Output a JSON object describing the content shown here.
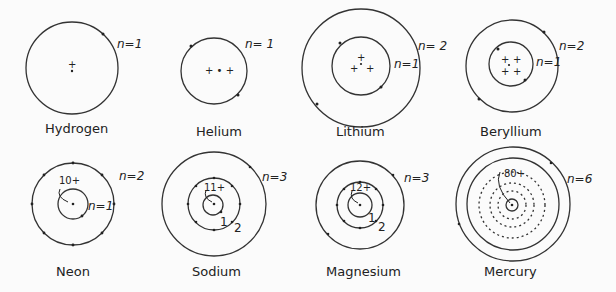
{
  "atoms": [
    {
      "name": "Hydrogen",
      "nucleus": "+",
      "shells": [
        "n=1"
      ],
      "electrons": [
        1
      ]
    },
    {
      "name": "Helium",
      "nucleus": "+ • +",
      "shells": [
        "n= 1"
      ],
      "electrons": [
        2
      ]
    },
    {
      "name": "Lithium",
      "nucleus": "+ + +",
      "shells": [
        "n=1",
        "n= 2"
      ],
      "electrons": [
        2,
        1
      ]
    },
    {
      "name": "Beryllium",
      "nucleus": "+ + + +",
      "shells": [
        "n=1",
        "n=2"
      ],
      "electrons": [
        2,
        2
      ]
    },
    {
      "name": "Neon",
      "nucleus": "10+",
      "shells": [
        "n=1",
        "n=2"
      ],
      "electrons": [
        2,
        8
      ]
    },
    {
      "name": "Sodium",
      "nucleus": "11+",
      "shells": [
        "1",
        "2",
        "n=3"
      ],
      "electrons": [
        2,
        8,
        1
      ]
    },
    {
      "name": "Magnesium",
      "nucleus": "12+",
      "shells": [
        "1",
        "2",
        "n=3"
      ],
      "electrons": [
        2,
        8,
        2
      ]
    },
    {
      "name": "Mercury",
      "nucleus": "80+",
      "shells": [
        "n=6"
      ],
      "electrons": [
        2,
        8,
        18,
        32,
        18,
        2
      ]
    }
  ]
}
